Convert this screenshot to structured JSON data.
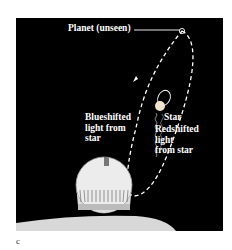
{
  "figure": {
    "panel_label": "c",
    "background_color": "#000000",
    "labels": {
      "planet": "Planet (unseen)",
      "star": "Star",
      "blueshifted": "Blueshifted\nlight from\nstar",
      "redshifted": "Redshifted\nlight\nfrom star"
    },
    "elements": [
      {
        "name": "planet-orbit",
        "style": "dashed ellipse",
        "color": "#ffffff"
      },
      {
        "name": "star-orbit",
        "style": "small ellipse",
        "color": "#ffffff"
      },
      {
        "name": "star",
        "color": "#f2e6d0"
      },
      {
        "name": "light-waves",
        "style": "wavy lines toward observatory"
      },
      {
        "name": "observatory-dome",
        "color": "#e8e8e8"
      }
    ]
  }
}
